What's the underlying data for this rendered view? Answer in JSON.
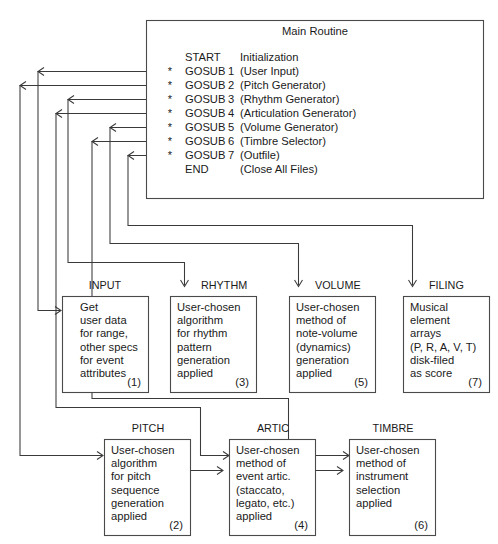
{
  "main_routine": {
    "title": "Main Routine",
    "lines": [
      {
        "star": "",
        "keyword": "START",
        "num": "",
        "desc": "Initialization"
      },
      {
        "star": "*",
        "keyword": "GOSUB",
        "num": "1",
        "desc": "(User Input)"
      },
      {
        "star": "*",
        "keyword": "GOSUB",
        "num": "2",
        "desc": "(Pitch Generator)"
      },
      {
        "star": "*",
        "keyword": "GOSUB",
        "num": "3",
        "desc": "(Rhythm Generator)"
      },
      {
        "star": "*",
        "keyword": "GOSUB",
        "num": "4",
        "desc": "(Articulation Generator)"
      },
      {
        "star": "*",
        "keyword": "GOSUB",
        "num": "5",
        "desc": "(Volume Generator)"
      },
      {
        "star": "*",
        "keyword": "GOSUB",
        "num": "6",
        "desc": "(Timbre Selector)"
      },
      {
        "star": "*",
        "keyword": "GOSUB",
        "num": "7",
        "desc": "(Outfile)"
      },
      {
        "star": "",
        "keyword": "END",
        "num": "",
        "desc": "(Close All Files)"
      }
    ]
  },
  "modules": [
    {
      "id": "input",
      "caption": "INPUT",
      "lines": [
        "Get",
        "user data",
        "for range,",
        "other specs",
        "for event",
        "attributes"
      ],
      "number": "(1)"
    },
    {
      "id": "rhythm",
      "caption": "RHYTHM",
      "lines": [
        "User-chosen",
        "algorithm",
        "for rhythm",
        "pattern",
        "generation",
        "applied"
      ],
      "number": "(3)"
    },
    {
      "id": "volume",
      "caption": "VOLUME",
      "lines": [
        "User-chosen",
        "method of",
        "note-volume",
        "(dynamics)",
        "generation",
        "applied"
      ],
      "number": "(5)"
    },
    {
      "id": "filing",
      "caption": "FILING",
      "lines": [
        "Musical",
        "element",
        "arrays",
        "(P, R, A, V, T)",
        "disk-filed",
        "as score"
      ],
      "number": "(7)"
    },
    {
      "id": "pitch",
      "caption": "PITCH",
      "lines": [
        "User-chosen",
        "algorithm",
        "for pitch",
        "sequence",
        "generation",
        "applied"
      ],
      "number": "(2)"
    },
    {
      "id": "artic",
      "caption": "ARTIC",
      "lines": [
        "User-chosen",
        "method of",
        "event artic.",
        "(staccato,",
        "legato, etc.)",
        "applied"
      ],
      "number": "(4)"
    },
    {
      "id": "timbre",
      "caption": "TIMBRE",
      "lines": [
        "User-chosen",
        "method of",
        "instrument",
        "selection",
        "applied"
      ],
      "number": "(6)"
    }
  ],
  "colors": {
    "background": "#ffffff",
    "box_stroke": "#4a4a4a",
    "connector": "#3a3a3a",
    "text": "#1a1a1a"
  }
}
